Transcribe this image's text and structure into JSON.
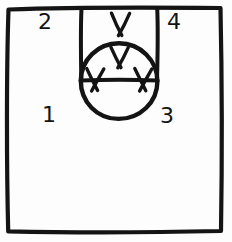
{
  "diagram": {
    "style": "hand-drawn pen sketch, black ink on white paper",
    "ink_color": "#141414",
    "background_color": "#fdfdfd",
    "canvas": {
      "width": 232,
      "height": 242
    },
    "shapes": [
      {
        "id": "outer-frame",
        "name": "outer-square-border",
        "type": "rectangle",
        "x": 7,
        "y": 7,
        "width": 215,
        "height": 225
      },
      {
        "id": "slot-left",
        "name": "slot-left-vertical-line",
        "type": "line",
        "x1": 81,
        "y1": 7,
        "x2": 81,
        "y2": 80
      },
      {
        "id": "slot-right",
        "name": "slot-right-vertical-line",
        "type": "line",
        "x1": 157,
        "y1": 7,
        "x2": 157,
        "y2": 80
      },
      {
        "id": "slot-bottom",
        "name": "horizontal-chord-line",
        "type": "line",
        "x1": 81,
        "y1": 80,
        "x2": 157,
        "y2": 80
      },
      {
        "id": "main-circle",
        "name": "central-circle",
        "type": "circle",
        "cx": 119,
        "cy": 81,
        "r": 38
      }
    ],
    "x_marks": [
      {
        "id": "x-top",
        "name": "x-mark-top-outside",
        "cx": 120,
        "cy": 24,
        "size": 11
      },
      {
        "id": "x-upper",
        "name": "x-mark-circle-top",
        "cx": 119,
        "cy": 57,
        "size": 10
      },
      {
        "id": "x-left",
        "name": "x-mark-circle-left",
        "cx": 95,
        "cy": 80,
        "size": 10
      },
      {
        "id": "x-right",
        "name": "x-mark-circle-right",
        "cx": 143,
        "cy": 80,
        "size": 10
      }
    ],
    "labels": [
      {
        "id": "label-1",
        "name": "quadrant-label-1",
        "text": "1",
        "x": 42,
        "y": 104,
        "quadrant": "lower-left"
      },
      {
        "id": "label-2",
        "name": "quadrant-label-2",
        "text": "2",
        "x": 38,
        "y": 11,
        "quadrant": "upper-left"
      },
      {
        "id": "label-3",
        "name": "quadrant-label-3",
        "text": "3",
        "x": 160,
        "y": 105,
        "quadrant": "lower-right"
      },
      {
        "id": "label-4",
        "name": "quadrant-label-4",
        "text": "4",
        "x": 167,
        "y": 11,
        "quadrant": "upper-right"
      }
    ]
  }
}
